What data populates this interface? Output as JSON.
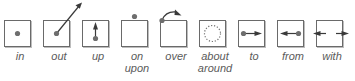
{
  "diagram": {
    "type": "preposition-icons",
    "colors": {
      "box_border": "#6a6a6a",
      "dot": "#6e6e6e",
      "arrow": "#3a3a3a",
      "label": "#5a5a5a"
    },
    "items": [
      {
        "id": "in",
        "icon": "dot-inside-box-icon",
        "label_lines": [
          "in"
        ]
      },
      {
        "id": "out",
        "icon": "arrow-out-of-box-icon",
        "label_lines": [
          "out"
        ]
      },
      {
        "id": "up",
        "icon": "arrow-up-icon",
        "label_lines": [
          "up"
        ]
      },
      {
        "id": "on",
        "icon": "dot-on-top-icon",
        "label_lines": [
          "on",
          "upon"
        ]
      },
      {
        "id": "over",
        "icon": "curved-arrow-over-icon",
        "label_lines": [
          "over"
        ]
      },
      {
        "id": "about",
        "icon": "dotted-circle-icon",
        "label_lines": [
          "about",
          "around"
        ]
      },
      {
        "id": "to",
        "icon": "arrow-right-from-dot-icon",
        "label_lines": [
          "to"
        ]
      },
      {
        "id": "from",
        "icon": "arrow-left-from-dot-icon",
        "label_lines": [
          "from"
        ]
      },
      {
        "id": "with",
        "icon": "arrows-converging-icon",
        "label_lines": [
          "with"
        ]
      }
    ]
  }
}
